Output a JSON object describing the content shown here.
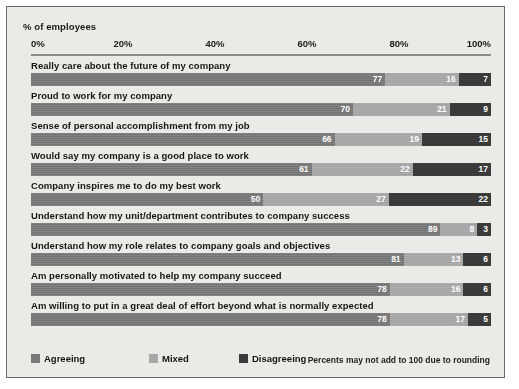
{
  "chart_data": {
    "type": "bar",
    "subtype": "horizontal-stacked-100",
    "title": "",
    "axis_title": "% of employees",
    "xlabel": "% of employees",
    "ylabel": "",
    "xlim": [
      0,
      100
    ],
    "grid": false,
    "legend_position": "bottom-left",
    "tick_labels": [
      "0%",
      "20%",
      "40%",
      "60%",
      "80%",
      "100%"
    ],
    "ticks": [
      0,
      20,
      40,
      60,
      80,
      100
    ],
    "categories": [
      "Really care about the future of my company",
      "Proud to work for my company",
      "Sense of personal accomplishment from my job",
      "Would say my company is a good place to work",
      "Company inspires me to do my best work",
      "Understand how my unit/department contributes to company success",
      "Understand how my role relates to company goals and objectives",
      "Am personally motivated to help my company succeed",
      "Am willing to put in a great deal of effort beyond what is normally expected"
    ],
    "series": [
      {
        "name": "Agreeing",
        "color": "#7a7a7a",
        "values": [
          77,
          70,
          66,
          61,
          50,
          89,
          81,
          78,
          78
        ]
      },
      {
        "name": "Mixed",
        "color": "#a8a8a8",
        "values": [
          16,
          21,
          19,
          22,
          27,
          8,
          13,
          16,
          17
        ]
      },
      {
        "name": "Disagreeing",
        "color": "#3a3a3a",
        "values": [
          7,
          9,
          15,
          17,
          22,
          3,
          6,
          6,
          5
        ]
      }
    ],
    "annotations": [
      "Percents may not add to 100 due to rounding"
    ]
  },
  "footnote": "Percents may not add to 100 due to rounding",
  "colors": {
    "agreeing": "#7a7a7a",
    "mixed": "#a8a8a8",
    "disagreeing": "#3a3a3a",
    "background": "#eceae6",
    "frame": "#6d6d6d"
  }
}
